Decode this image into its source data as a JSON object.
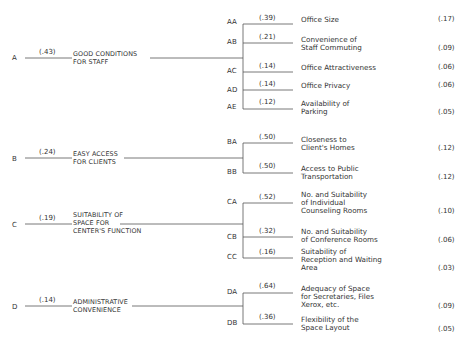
{
  "diagram": {
    "type": "hierarchy-tree",
    "criteria": [
      {
        "id": "A",
        "weight": "(.43)",
        "label_line1": "GOOD CONDITIONS",
        "label_line2": "FOR STAFF",
        "subcriteria": [
          {
            "id": "AA",
            "weight": "(.39)",
            "label_line1": "Office Size",
            "label_line2": "",
            "label_line3": "",
            "global_weight": "(.17)"
          },
          {
            "id": "AB",
            "weight": "(.21)",
            "label_line1": "Convenience of",
            "label_line2": "Staff Commuting",
            "label_line3": "",
            "global_weight": "(.09)"
          },
          {
            "id": "AC",
            "weight": "(.14)",
            "label_line1": "Office Attractiveness",
            "label_line2": "",
            "label_line3": "",
            "global_weight": "(.06)"
          },
          {
            "id": "AD",
            "weight": "(.14)",
            "label_line1": "Office Privacy",
            "label_line2": "",
            "label_line3": "",
            "global_weight": "(.06)"
          },
          {
            "id": "AE",
            "weight": "(.12)",
            "label_line1": "Availability of",
            "label_line2": "Parking",
            "label_line3": "",
            "global_weight": "(.05)"
          }
        ]
      },
      {
        "id": "B",
        "weight": "(.24)",
        "label_line1": "EASY ACCESS",
        "label_line2": "FOR CLIENTS",
        "subcriteria": [
          {
            "id": "BA",
            "weight": "(.50)",
            "label_line1": "Closeness to",
            "label_line2": "Client's Homes",
            "label_line3": "",
            "global_weight": "(.12)"
          },
          {
            "id": "BB",
            "weight": "(.50)",
            "label_line1": "Access to Public",
            "label_line2": "Transportation",
            "label_line3": "",
            "global_weight": "(.12)"
          }
        ]
      },
      {
        "id": "C",
        "weight": "(.19)",
        "label_line1": "SUITABILITY OF",
        "label_line2": "SPACE FOR",
        "label_line3": "CENTER'S FUNCTION",
        "subcriteria": [
          {
            "id": "CA",
            "weight": "(.52)",
            "label_line1": "No. and Suitability",
            "label_line2": "of Individual",
            "label_line3": "Counseling Rooms",
            "global_weight": "(.10)"
          },
          {
            "id": "CB",
            "weight": "(.32)",
            "label_line1": "No. and Suitability",
            "label_line2": "of Conference Rooms",
            "label_line3": "",
            "global_weight": "(.06)"
          },
          {
            "id": "CC",
            "weight": "(.16)",
            "label_line1": "Suitability of",
            "label_line2": "Reception and Waiting",
            "label_line3": "Area",
            "global_weight": "(.03)"
          }
        ]
      },
      {
        "id": "D",
        "weight": "(.14)",
        "label_line1": "ADMINISTRATIVE",
        "label_line2": "CONVENIENCE",
        "subcriteria": [
          {
            "id": "DA",
            "weight": "(.64)",
            "label_line1": "Adequacy of Space",
            "label_line2": "for Secretaries, Files",
            "label_line3": "Xerox, etc.",
            "global_weight": "(.09)"
          },
          {
            "id": "DB",
            "weight": "(.36)",
            "label_line1": "Flexibility of the",
            "label_line2": "Space Layout",
            "label_line3": "",
            "global_weight": "(.05)"
          }
        ]
      }
    ]
  }
}
